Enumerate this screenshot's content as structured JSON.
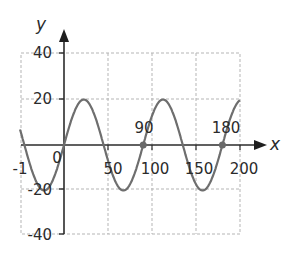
{
  "chart_data": {
    "type": "line",
    "title": "",
    "xlabel": "x",
    "ylabel": "y",
    "xlim": [
      -50,
      200
    ],
    "ylim": [
      -40,
      40
    ],
    "grid": true,
    "x_ticks": [
      -1,
      0,
      50,
      100,
      150,
      200
    ],
    "x_tick_labels": [
      "-1",
      "0",
      "50",
      "100",
      "150",
      "200"
    ],
    "y_ticks": [
      40,
      20,
      -20,
      -40
    ],
    "y_tick_labels": [
      "40",
      "20",
      "-20",
      "-40"
    ],
    "series": [
      {
        "name": "y = 20 sin(4x)",
        "amplitude": 20,
        "period": 90,
        "x": [
          -50,
          -22.5,
          0,
          22.5,
          45,
          67.5,
          90,
          112.5,
          135,
          157.5,
          180,
          200
        ],
        "values": [
          6.8,
          -20,
          0,
          20,
          0,
          -20,
          0,
          20,
          0,
          -20,
          0,
          17.3
        ]
      }
    ],
    "annotations": [
      {
        "label": "90",
        "x": 90,
        "y": 0,
        "marker": "dot"
      },
      {
        "label": "180",
        "x": 180,
        "y": 0,
        "marker": "dot"
      }
    ],
    "colors": {
      "curve": "#6e6e6e",
      "axis": "#333333",
      "grid": "#b0b0b0"
    }
  }
}
